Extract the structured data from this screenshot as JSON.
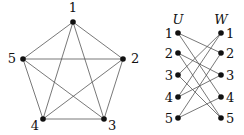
{
  "diagram": {
    "complete_graph": {
      "nodes": [
        {
          "id": "1",
          "label": "1",
          "x": 73,
          "y": 22,
          "lx": 73,
          "ly": 12,
          "anchor": "middle"
        },
        {
          "id": "2",
          "label": "2",
          "x": 123,
          "y": 59,
          "lx": 131,
          "ly": 63,
          "anchor": "start"
        },
        {
          "id": "3",
          "label": "3",
          "x": 104,
          "y": 119,
          "lx": 108,
          "ly": 130,
          "anchor": "start"
        },
        {
          "id": "4",
          "label": "4",
          "x": 43,
          "y": 119,
          "lx": 39,
          "ly": 130,
          "anchor": "end"
        },
        {
          "id": "5",
          "label": "5",
          "x": 23,
          "y": 59,
          "lx": 16,
          "ly": 63,
          "anchor": "end"
        }
      ],
      "edges": [
        [
          "1",
          "2"
        ],
        [
          "1",
          "3"
        ],
        [
          "1",
          "4"
        ],
        [
          "1",
          "5"
        ],
        [
          "2",
          "3"
        ],
        [
          "2",
          "4"
        ],
        [
          "2",
          "5"
        ],
        [
          "3",
          "4"
        ],
        [
          "3",
          "5"
        ],
        [
          "4",
          "5"
        ]
      ]
    },
    "bipartite_graph": {
      "left_set_label": "U",
      "right_set_label": "W",
      "left_set_label_pos": {
        "x": 178,
        "y": 24
      },
      "right_set_label_pos": {
        "x": 221,
        "y": 24
      },
      "left_nodes": [
        {
          "id": "U1",
          "label": "1",
          "x": 178,
          "y": 33
        },
        {
          "id": "U2",
          "label": "2",
          "x": 178,
          "y": 53
        },
        {
          "id": "U3",
          "label": "3",
          "x": 178,
          "y": 75
        },
        {
          "id": "U4",
          "label": "4",
          "x": 178,
          "y": 97
        },
        {
          "id": "U5",
          "label": "5",
          "x": 178,
          "y": 118
        }
      ],
      "right_nodes": [
        {
          "id": "W1",
          "label": "1",
          "x": 221,
          "y": 33
        },
        {
          "id": "W2",
          "label": "2",
          "x": 221,
          "y": 53
        },
        {
          "id": "W3",
          "label": "3",
          "x": 221,
          "y": 75
        },
        {
          "id": "W4",
          "label": "4",
          "x": 221,
          "y": 97
        },
        {
          "id": "W5",
          "label": "5",
          "x": 221,
          "y": 118
        }
      ],
      "edges": [
        [
          "U1",
          "W2"
        ],
        [
          "U1",
          "W4"
        ],
        [
          "U2",
          "W3"
        ],
        [
          "U2",
          "W5"
        ],
        [
          "U3",
          "W1"
        ],
        [
          "U3",
          "W5"
        ],
        [
          "U4",
          "W1"
        ],
        [
          "U4",
          "W3"
        ],
        [
          "U5",
          "W2"
        ],
        [
          "U5",
          "W4"
        ]
      ]
    }
  }
}
